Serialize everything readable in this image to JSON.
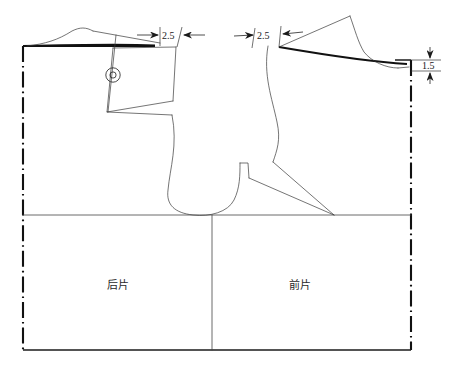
{
  "diagram": {
    "type": "sewing pattern technical drawing",
    "dimensions": [
      {
        "id": "back-shoulder-extension",
        "label": "2.5",
        "unit": "cm",
        "orientation": "horizontal",
        "side": "left"
      },
      {
        "id": "front-shoulder-extension",
        "label": "2.5",
        "unit": "cm",
        "orientation": "horizontal",
        "side": "right"
      },
      {
        "id": "front-neck-drop",
        "label": "1.5",
        "unit": "cm",
        "orientation": "vertical",
        "side": "right"
      }
    ],
    "labels": {
      "back_piece": "后片",
      "front_piece": "前片"
    },
    "symbols": [
      {
        "id": "pivot-point",
        "glyph": "circle-with-slash",
        "meaning": "rotation pivot marker"
      }
    ],
    "colors": {
      "ink": "#111111",
      "thin_line": "#3a3a3a",
      "background": "#ffffff"
    }
  }
}
